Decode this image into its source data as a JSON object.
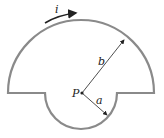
{
  "diagram": {
    "labels": {
      "current": "i",
      "big_radius": "b",
      "small_radius": "a",
      "point": "P"
    },
    "geometry": {
      "center": [
        81,
        93
      ],
      "b": 73,
      "a": 36
    },
    "colors": {
      "wire": "#8a8a8a",
      "ink": "#222222"
    }
  }
}
